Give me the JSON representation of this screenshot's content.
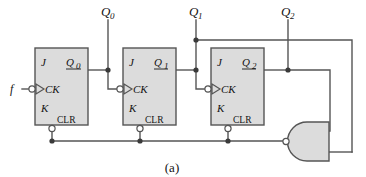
{
  "figure": {
    "caption": "(a)",
    "type": "jk-flip-flop-ripple-counter"
  },
  "colors": {
    "box_fill": "#dcdcdc",
    "box_stroke": "#555555",
    "wire": "#555555",
    "text": "#141414",
    "background": "#ffffff",
    "gate_fill": "#dcdcdc"
  },
  "inputs": {
    "clock": {
      "label": "f",
      "inverted": true
    }
  },
  "outputs": [
    {
      "label": "Q",
      "subscript": "0"
    },
    {
      "label": "Q",
      "subscript": "1"
    },
    {
      "label": "Q",
      "subscript": "2"
    }
  ],
  "flipflops": [
    {
      "id": "ff0",
      "j_label": "J",
      "k_label": "K",
      "ck_label": "CK",
      "clr_label": "CLR",
      "q_label": "Q",
      "q_subscript": "0"
    },
    {
      "id": "ff1",
      "j_label": "J",
      "k_label": "K",
      "ck_label": "CK",
      "clr_label": "CLR",
      "q_label": "Q",
      "q_subscript": "1"
    },
    {
      "id": "ff2",
      "j_label": "J",
      "k_label": "K",
      "ck_label": "CK",
      "clr_label": "CLR",
      "q_label": "Q",
      "q_subscript": "2"
    }
  ],
  "gate": {
    "kind": "and-gate",
    "output_inverted": true,
    "input_count": 2,
    "drives": "CLR"
  }
}
